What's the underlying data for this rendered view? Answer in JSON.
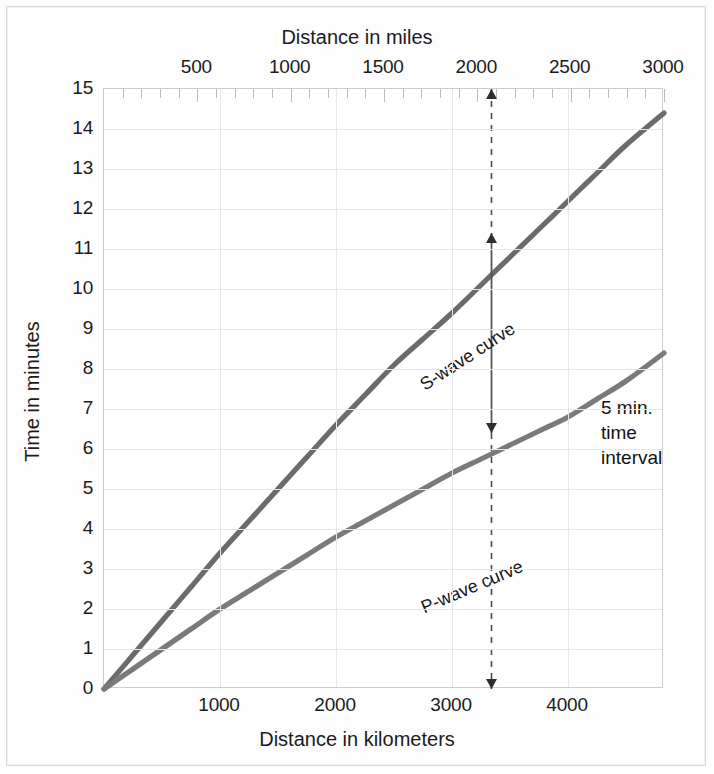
{
  "titles": {
    "top_axis": "Distance in miles",
    "bottom_axis": "Distance in kilometers",
    "left_axis": "Time in minutes"
  },
  "annotation": {
    "line1": "5 min.",
    "line2": "time",
    "line3": "interval"
  },
  "curve_labels": {
    "s_wave": "S-wave curve",
    "p_wave": "P-wave curve"
  },
  "chart_data": {
    "type": "line",
    "title": "",
    "xlabel": "Distance in kilometers",
    "ylabel": "Time in minutes",
    "xlabel_secondary": "Distance in miles",
    "xlim": [
      0,
      4827
    ],
    "ylim": [
      0,
      15
    ],
    "xlim_miles": [
      0,
      3000
    ],
    "grid": true,
    "legend": "inline-curve-labels",
    "x_ticks_km": [
      1000,
      2000,
      3000,
      4000
    ],
    "x_ticks_miles": [
      500,
      1000,
      1500,
      2000,
      2500,
      3000
    ],
    "y_ticks": [
      0,
      1,
      2,
      3,
      4,
      5,
      6,
      7,
      8,
      9,
      10,
      11,
      12,
      13,
      14,
      15
    ],
    "series": [
      {
        "name": "S-wave curve",
        "color": "#6b6b6b",
        "x": [
          0,
          250,
          500,
          750,
          1000,
          1250,
          1500,
          1750,
          2000,
          2250,
          2500,
          2750,
          3000,
          3250,
          3500,
          3750,
          4000,
          4250,
          4500,
          4827
        ],
        "y": [
          0,
          0.85,
          1.7,
          2.55,
          3.4,
          4.2,
          5.0,
          5.8,
          6.6,
          7.35,
          8.1,
          8.75,
          9.4,
          10.1,
          10.8,
          11.5,
          12.2,
          12.9,
          13.6,
          14.4
        ]
      },
      {
        "name": "P-wave curve",
        "color": "#7a7a7a",
        "x": [
          0,
          250,
          500,
          750,
          1000,
          1250,
          1500,
          1750,
          2000,
          2250,
          2500,
          2750,
          3000,
          3250,
          3500,
          3750,
          4000,
          4250,
          4500,
          4827
        ],
        "y": [
          0,
          0.5,
          1.0,
          1.5,
          2.0,
          2.45,
          2.9,
          3.35,
          3.8,
          4.2,
          4.6,
          5.0,
          5.4,
          5.75,
          6.1,
          6.45,
          6.8,
          7.25,
          7.7,
          8.4
        ]
      }
    ],
    "annotations": [
      {
        "type": "vertical-interval",
        "x_km": 3340,
        "x_miles": 2075,
        "y_from": 6.4,
        "y_to": 11.4,
        "value_minutes": 5,
        "label": "5 min. time interval"
      }
    ]
  }
}
